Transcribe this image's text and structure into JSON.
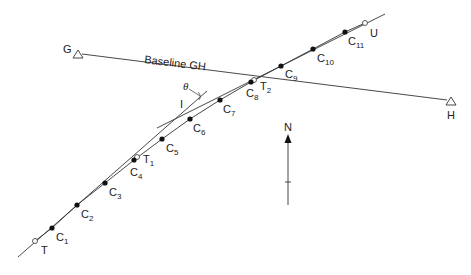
{
  "diagram": {
    "type": "survey-curve-setting-out",
    "colors": {
      "line": "#333333",
      "point_fill": "#111111",
      "background": "#ffffff"
    },
    "baseline": {
      "label": "Baseline GH",
      "start": {
        "label": "G",
        "symbol": "triangle"
      },
      "end": {
        "label": "H",
        "symbol": "triangle"
      }
    },
    "tangent_points": [
      {
        "label": "T",
        "sub": ""
      },
      {
        "label": "T",
        "sub": "1"
      },
      {
        "label": "T",
        "sub": "2"
      },
      {
        "label": "U",
        "sub": ""
      }
    ],
    "intersection": {
      "label": "I",
      "angle_label": "θ"
    },
    "curve_points": [
      {
        "label": "C",
        "sub": "1"
      },
      {
        "label": "C",
        "sub": "2"
      },
      {
        "label": "C",
        "sub": "3"
      },
      {
        "label": "C",
        "sub": "4"
      },
      {
        "label": "C",
        "sub": "5"
      },
      {
        "label": "C",
        "sub": "6"
      },
      {
        "label": "C",
        "sub": "7"
      },
      {
        "label": "C",
        "sub": "8"
      },
      {
        "label": "C",
        "sub": "9"
      },
      {
        "label": "C",
        "sub": "10"
      },
      {
        "label": "C",
        "sub": "11"
      }
    ],
    "north_arrow": {
      "label": "N"
    }
  }
}
